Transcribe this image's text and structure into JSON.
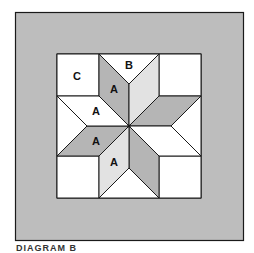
{
  "diagram": {
    "colors": {
      "border": "#bdbdbd",
      "white": "#ffffff",
      "dark_gray": "#b5b5b5",
      "light_gray": "#e2e2e2",
      "stroke": "#1a1a1a"
    },
    "labels": [
      {
        "text": "C",
        "x": 77,
        "y": 80
      },
      {
        "text": "B",
        "x": 129,
        "y": 70
      },
      {
        "text": "A",
        "x": 114,
        "y": 95
      },
      {
        "text": "A",
        "x": 96,
        "y": 115
      },
      {
        "text": "A",
        "x": 96,
        "y": 145
      },
      {
        "text": "A",
        "x": 114,
        "y": 166
      }
    ]
  },
  "caption": "DIAGRAM B"
}
